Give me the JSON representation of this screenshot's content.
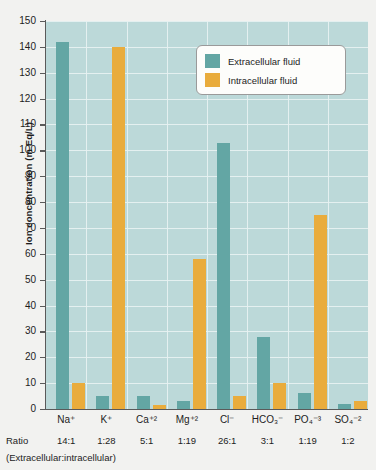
{
  "chart_data": {
    "type": "bar",
    "title": "",
    "xlabel": "",
    "ylabel": "Ion concentration (m Eq/L)",
    "ylim": [
      0,
      150
    ],
    "ytick_step": 10,
    "yticks": [
      0,
      10,
      20,
      30,
      40,
      50,
      60,
      70,
      80,
      90,
      100,
      110,
      120,
      130,
      140,
      150
    ],
    "grid": true,
    "legend_position": "top-right",
    "categories": [
      "Na⁺",
      "K⁺",
      "Ca⁺²",
      "Mg⁺²",
      "Cl⁻",
      "HCO₃⁻",
      "PO₄⁻³",
      "SO₄⁻²"
    ],
    "category_labels_plain": [
      "Na+",
      "K+",
      "Ca+2",
      "Mg+2",
      "Cl-",
      "HCO3-",
      "PO4-3",
      "SO4-2"
    ],
    "series": [
      {
        "name": "Extracellular fluid",
        "color": "#63a6a4",
        "values": [
          142,
          5,
          5,
          3,
          103,
          28,
          6,
          2
        ]
      },
      {
        "name": "Intracellular fluid",
        "color": "#e9ac3c",
        "values": [
          10,
          140,
          1.5,
          58,
          5,
          10,
          75,
          3
        ]
      }
    ],
    "ratios": [
      "14:1",
      "1:28",
      "5:1",
      "1:19",
      "26:1",
      "3:1",
      "1:19",
      "1:2"
    ],
    "ratio_row_label": "Ratio",
    "ratio_caption": "(Extracellular:intracellular)"
  },
  "legend": {
    "items": [
      {
        "label": "Extracellular fluid",
        "color": "#63a6a4"
      },
      {
        "label": "Intracellular fluid",
        "color": "#e9ac3c"
      }
    ]
  },
  "colors": {
    "plot_background": "#bcd9d9",
    "grid": "#e6f1f1",
    "page_background": "#f2f2f0",
    "axis": "#5a5a5a",
    "extracellular": "#63a6a4",
    "intracellular": "#e9ac3c"
  }
}
